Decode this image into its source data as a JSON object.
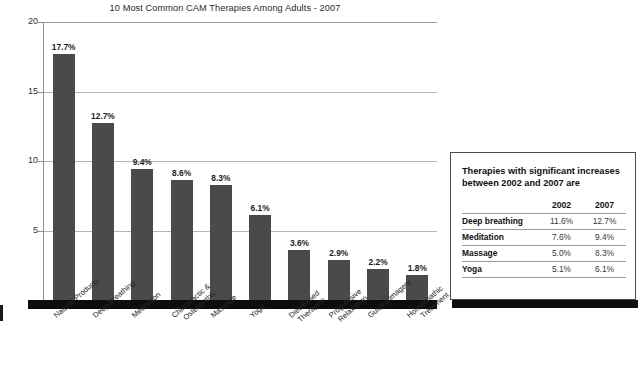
{
  "chart_data": {
    "type": "bar",
    "title": "10 Most Common CAM Therapies Among Adults - 2007",
    "xlabel": "",
    "ylabel": "",
    "ylim": [
      0,
      20
    ],
    "yticks": [
      20,
      15,
      10,
      5
    ],
    "grid": true,
    "legend": "none",
    "bar_color": "#4a4a4a",
    "categories": [
      "Natural Products",
      "Deep Breathing",
      "Meditation",
      "Chiropractic & Osteopathic",
      "Massage",
      "Yoga",
      "Diet-Based Therapies",
      "Progressive Relaxation",
      "Guided Imagery",
      "Homeopathic Treatment"
    ],
    "category_lines": [
      [
        "Natural Products"
      ],
      [
        "Deep Breathing"
      ],
      [
        "Meditation"
      ],
      [
        "Chiropractic &",
        "Osteopathic"
      ],
      [
        "Massage"
      ],
      [
        "Yoga"
      ],
      [
        "Diet-Based",
        "Therapies"
      ],
      [
        "Progressive",
        "Relaxation"
      ],
      [
        "Guided Imagery"
      ],
      [
        "Homeopathic",
        "Treatment"
      ]
    ],
    "values": [
      17.7,
      12.7,
      9.4,
      8.6,
      8.3,
      6.1,
      3.6,
      2.9,
      2.2,
      1.8
    ],
    "data_labels": [
      "17.7%",
      "12.7%",
      "9.4%",
      "8.6%",
      "8.3%",
      "6.1%",
      "3.6%",
      "2.9%",
      "2.2%",
      "1.8%"
    ]
  },
  "side_table": {
    "heading": "Therapies with significant increases between 2002 and 2007 are",
    "columns": [
      "",
      "2002",
      "2007"
    ],
    "rows": [
      {
        "therapy": "Deep breathing",
        "y2002": "11.6%",
        "y2007": "12.7%"
      },
      {
        "therapy": "Meditation",
        "y2002": "7.6%",
        "y2007": "9.4%"
      },
      {
        "therapy": "Massage",
        "y2002": "5.0%",
        "y2007": "8.3%"
      },
      {
        "therapy": "Yoga",
        "y2002": "5.1%",
        "y2007": "6.1%"
      }
    ]
  }
}
